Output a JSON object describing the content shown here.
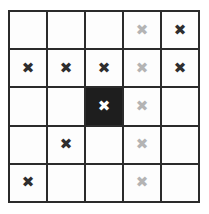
{
  "board": {
    "rows": 5,
    "cols": 5,
    "mark_glyph": "✖",
    "colors": {
      "grid_line": "#2b2b2b",
      "cell_empty": "#fdfdfd",
      "cell_filled": "#1e1e1e",
      "mark_dark": "#2e2e2e",
      "mark_light": "#b4b4b4",
      "mark_white": "#ffffff"
    },
    "cells": [
      [
        {
          "fill": "empty",
          "mark": null
        },
        {
          "fill": "empty",
          "mark": null
        },
        {
          "fill": "empty",
          "mark": null
        },
        {
          "fill": "empty",
          "mark": "light"
        },
        {
          "fill": "empty",
          "mark": "dark"
        }
      ],
      [
        {
          "fill": "empty",
          "mark": "dark"
        },
        {
          "fill": "empty",
          "mark": "dark"
        },
        {
          "fill": "empty",
          "mark": "dark"
        },
        {
          "fill": "empty",
          "mark": "light"
        },
        {
          "fill": "empty",
          "mark": "dark"
        }
      ],
      [
        {
          "fill": "empty",
          "mark": null
        },
        {
          "fill": "empty",
          "mark": null
        },
        {
          "fill": "filled",
          "mark": "white"
        },
        {
          "fill": "empty",
          "mark": "light"
        },
        {
          "fill": "empty",
          "mark": null
        }
      ],
      [
        {
          "fill": "empty",
          "mark": null
        },
        {
          "fill": "empty",
          "mark": "dark"
        },
        {
          "fill": "empty",
          "mark": null
        },
        {
          "fill": "empty",
          "mark": "light"
        },
        {
          "fill": "empty",
          "mark": null
        }
      ],
      [
        {
          "fill": "empty",
          "mark": "dark"
        },
        {
          "fill": "empty",
          "mark": null
        },
        {
          "fill": "empty",
          "mark": null
        },
        {
          "fill": "empty",
          "mark": "light"
        },
        {
          "fill": "empty",
          "mark": null
        }
      ]
    ]
  }
}
